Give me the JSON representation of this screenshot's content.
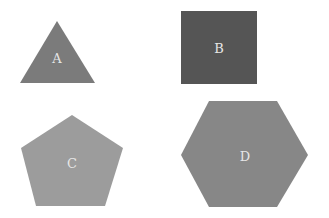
{
  "diagram": {
    "background": "#ffffff",
    "shapes": [
      {
        "id": "A",
        "type": "triangle",
        "label": "A",
        "fill": "#7b7b7b",
        "points": "57,21 95,83 20,83",
        "label_pos": {
          "x": 57,
          "y": 58
        }
      },
      {
        "id": "B",
        "type": "square",
        "label": "B",
        "fill": "#555555",
        "points": "181,11 257,11 257,84 181,84",
        "label_pos": {
          "x": 219,
          "y": 48
        }
      },
      {
        "id": "C",
        "type": "pentagon",
        "label": "C",
        "fill": "#9c9c9c",
        "points": "72,115 123,148 105,206 36,206 21,148",
        "label_pos": {
          "x": 72,
          "y": 163
        }
      },
      {
        "id": "D",
        "type": "hexagon",
        "label": "D",
        "fill": "#878787",
        "points": "209,101 277,101 308,155 277,207 209,207 181,155",
        "label_pos": {
          "x": 245,
          "y": 156
        }
      }
    ]
  }
}
